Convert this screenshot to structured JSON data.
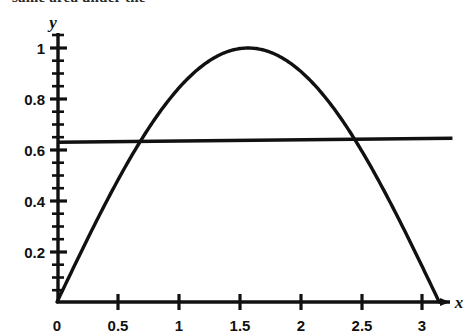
{
  "figure": {
    "caption_fragment": "same area under the",
    "background_color": "#ffffff",
    "ink_color": "#111111"
  },
  "chart_data": {
    "type": "line",
    "title": "",
    "subtitle": "",
    "xlabel": "x",
    "ylabel": "y",
    "xlim": [
      0,
      3.25
    ],
    "ylim": [
      0,
      1.08
    ],
    "grid": false,
    "legend": "none",
    "x_ticks": [
      0,
      0.5,
      1,
      1.5,
      2,
      2.5,
      3
    ],
    "x_tick_labels": [
      "0",
      "0.5",
      "1",
      "1.5",
      "2",
      "2.5",
      "3"
    ],
    "y_ticks": [
      0.2,
      0.4,
      0.6,
      0.8,
      1
    ],
    "y_tick_labels": [
      "0.2",
      "0.4",
      "0.6",
      "0.8",
      "1"
    ],
    "y_minor_tick_step": 0.05,
    "series": [
      {
        "name": "sine-curve",
        "kind": "curve",
        "expression": "y = sin(x)",
        "domain": [
          0,
          3.14159
        ],
        "line_color": "#111111",
        "line_width": 3.4,
        "x": [
          0,
          0.1571,
          0.3142,
          0.4712,
          0.6283,
          0.7854,
          0.9425,
          1.0996,
          1.2566,
          1.4137,
          1.5708,
          1.7279,
          1.885,
          2.042,
          2.1991,
          2.3562,
          2.5133,
          2.6704,
          2.8274,
          2.9845,
          3.1416
        ],
        "values": [
          0,
          0.1564,
          0.309,
          0.454,
          0.5878,
          0.7071,
          0.809,
          0.891,
          0.9511,
          0.9877,
          1.0,
          0.9877,
          0.9511,
          0.891,
          0.809,
          0.7071,
          0.5878,
          0.454,
          0.309,
          0.1564,
          0.0
        ]
      },
      {
        "name": "mean-value-line",
        "kind": "horizontal-line",
        "expression": "y = 2/pi",
        "level": 0.6366,
        "domain": [
          0,
          3.25
        ],
        "line_color": "#111111",
        "line_width": 3.4
      }
    ],
    "annotations": [
      {
        "name": "left-intersection",
        "x": 0.69,
        "y": 0.6366
      },
      {
        "name": "right-intersection",
        "x": 2.45,
        "y": 0.6366
      },
      {
        "name": "curve-peak",
        "x": 1.5708,
        "y": 1.0
      }
    ]
  }
}
